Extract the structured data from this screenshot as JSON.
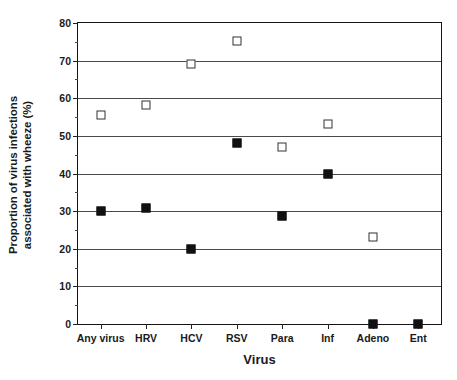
{
  "chart_data": {
    "type": "scatter",
    "title": "",
    "xlabel": "Virus",
    "ylabel": "Proportion of virus infections associated with wheeze (%)",
    "ylabel_lines": [
      "Proportion of virus infections",
      "associated with wheeze (%)"
    ],
    "categories": [
      "Any virus",
      "HRV",
      "HCV",
      "RSV",
      "Para",
      "Inf",
      "Adeno",
      "Ent"
    ],
    "ylim": [
      0,
      80
    ],
    "yticks": [
      0,
      10,
      20,
      30,
      40,
      50,
      60,
      70,
      80
    ],
    "ytick_labels": [
      "0",
      "10",
      "20",
      "30",
      "40",
      "50",
      "60",
      "70",
      "80"
    ],
    "grid": true,
    "grid_axis": "y",
    "legend": "none",
    "series": [
      {
        "name": "open-square-series",
        "marker": "open-square",
        "color": "#333333",
        "values": [
          55.5,
          58.2,
          69.2,
          75.1,
          47.0,
          53.2,
          23.2,
          null
        ]
      },
      {
        "name": "filled-square-series",
        "marker": "filled-square",
        "color": "#111111",
        "values": [
          30.1,
          30.7,
          20.0,
          48.0,
          28.7,
          40.0,
          0.0,
          0.0
        ]
      }
    ]
  },
  "colors": {
    "axis": "#141414",
    "grid": "#4a4a4a",
    "text": "#1a1a1a",
    "background": "#ffffff"
  }
}
